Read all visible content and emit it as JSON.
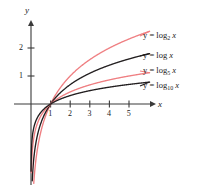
{
  "figure": {
    "axis_x_name": "x",
    "axis_y_name": "y",
    "colors": {
      "red": "#ef7f82",
      "black": "#231f20",
      "axis": "#3a3a3a"
    }
  },
  "ticks": {
    "x": [
      "1",
      "2",
      "3",
      "4",
      "5"
    ],
    "y": [
      "1",
      "2"
    ]
  },
  "labels": [
    {
      "id": "log2",
      "prefix": "y = log",
      "sub": "2",
      "suffix": "x",
      "color": "#ef7f82"
    },
    {
      "id": "log",
      "prefix": "y = log",
      "sub": "",
      "suffix": "x",
      "color": "#231f20"
    },
    {
      "id": "log5",
      "prefix": "y = log",
      "sub": "5",
      "suffix": "x",
      "color": "#ef7f82"
    },
    {
      "id": "log10",
      "prefix": "y = log",
      "sub": "10",
      "suffix": "x",
      "color": "#231f20"
    }
  ],
  "chart_data": {
    "type": "line",
    "title": "",
    "xlabel": "x",
    "ylabel": "y",
    "xlim": [
      0,
      6.2
    ],
    "ylim": [
      -3.0,
      2.9
    ],
    "grid": false,
    "legend_position": "right-inline-labels",
    "xticks": [
      1,
      2,
      3,
      4,
      5
    ],
    "yticks": [
      1,
      2
    ],
    "series": [
      {
        "name": "y = log_2 x",
        "base": 2,
        "color": "#ef7f82",
        "x": [
          0.1,
          0.2,
          0.3,
          0.4,
          0.5,
          0.7,
          1.0,
          1.5,
          2.0,
          2.5,
          3.0,
          3.5,
          4.0,
          4.5,
          5.0,
          5.5,
          6.0
        ],
        "y": [
          -3.32,
          -2.32,
          -1.74,
          -1.32,
          -1.0,
          -0.51,
          0.0,
          0.58,
          1.0,
          1.32,
          1.58,
          1.81,
          2.0,
          2.17,
          2.32,
          2.46,
          2.58
        ]
      },
      {
        "name": "y = log x",
        "base": "e",
        "color": "#231f20",
        "x": [
          0.1,
          0.2,
          0.3,
          0.4,
          0.5,
          0.7,
          1.0,
          1.5,
          2.0,
          2.5,
          3.0,
          3.5,
          4.0,
          4.5,
          5.0,
          5.5,
          6.0
        ],
        "y": [
          -2.3,
          -1.61,
          -1.2,
          -0.92,
          -0.69,
          -0.36,
          0.0,
          0.41,
          0.69,
          0.92,
          1.1,
          1.25,
          1.39,
          1.5,
          1.61,
          1.7,
          1.79
        ]
      },
      {
        "name": "y = log_5 x",
        "base": 5,
        "color": "#ef7f82",
        "x": [
          0.1,
          0.2,
          0.3,
          0.4,
          0.5,
          0.7,
          1.0,
          1.5,
          2.0,
          2.5,
          3.0,
          3.5,
          4.0,
          4.5,
          5.0,
          5.5,
          6.0
        ],
        "y": [
          -1.43,
          -1.0,
          -0.75,
          -0.57,
          -0.43,
          -0.22,
          0.0,
          0.25,
          0.43,
          0.57,
          0.68,
          0.78,
          0.86,
          0.93,
          1.0,
          1.06,
          1.11
        ]
      },
      {
        "name": "y = log_10 x",
        "base": 10,
        "color": "#231f20",
        "x": [
          0.1,
          0.2,
          0.3,
          0.4,
          0.5,
          0.7,
          1.0,
          1.5,
          2.0,
          2.5,
          3.0,
          3.5,
          4.0,
          4.5,
          5.0,
          5.5,
          6.0
        ],
        "y": [
          -1.0,
          -0.7,
          -0.52,
          -0.4,
          -0.3,
          -0.15,
          0.0,
          0.18,
          0.3,
          0.4,
          0.48,
          0.54,
          0.6,
          0.65,
          0.7,
          0.74,
          0.78
        ]
      }
    ]
  }
}
